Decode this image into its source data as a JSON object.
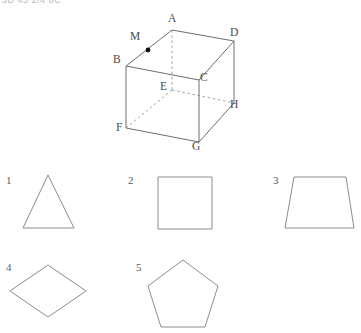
{
  "header": {
    "clipped_text": "3D 45 2/4 6C"
  },
  "cube": {
    "vertices": [
      {
        "id": "A",
        "label": "A",
        "label_x": 168,
        "label_y": 22,
        "x": 72,
        "y": 22
      },
      {
        "id": "D",
        "label": "D",
        "label_x": 230,
        "label_y": 36,
        "x": 134,
        "y": 33
      },
      {
        "id": "M",
        "label": "M",
        "label_x": 130,
        "label_y": 40,
        "x": 48,
        "y": 42
      },
      {
        "id": "B",
        "label": "B",
        "label_x": 113,
        "label_y": 63,
        "x": 26,
        "y": 58
      },
      {
        "id": "C",
        "label": "C",
        "label_x": 200,
        "label_y": 81,
        "x": 99,
        "y": 72
      },
      {
        "id": "E",
        "label": "E",
        "label_x": 160,
        "label_y": 90,
        "x": 72,
        "y": 82
      },
      {
        "id": "H",
        "label": "H",
        "label_x": 230,
        "label_y": 108,
        "x": 134,
        "y": 95
      },
      {
        "id": "F",
        "label": "F",
        "label_x": 116,
        "label_y": 131,
        "x": 26,
        "y": 120
      },
      {
        "id": "G",
        "label": "G",
        "label_x": 192,
        "label_y": 150,
        "x": 99,
        "y": 134
      }
    ],
    "marked_point": {
      "id": "M",
      "on_edge": "BA",
      "filled": true
    },
    "solid_edges": [
      "B-A",
      "A-D",
      "B-C",
      "C-D",
      "D-H",
      "B-F",
      "C-G",
      "F-G",
      "G-H"
    ],
    "hidden_edges": [
      "A-E",
      "E-F",
      "E-H"
    ]
  },
  "shapes": [
    {
      "number": "1",
      "name": "triangle",
      "num_x": 6,
      "num_y": 184,
      "points": "48,175 23,228 74,228"
    },
    {
      "number": "2",
      "name": "square",
      "num_x": 128,
      "num_y": 184,
      "points": "158,177 158,229 212,229 212,177"
    },
    {
      "number": "3",
      "name": "trapezoid",
      "num_x": 273,
      "num_y": 184,
      "points": "294,177 346,177 354,228 285,228"
    },
    {
      "number": "4",
      "name": "rhombus",
      "num_x": 6,
      "num_y": 271,
      "points": "48,265 86,291 48,317 10,291"
    },
    {
      "number": "5",
      "name": "pentagon",
      "num_x": 136,
      "num_y": 271,
      "points": "183,260 218,286 205,327 161,327 148,286"
    }
  ],
  "colors": {
    "stroke": "#8d8d8d",
    "edge": "#6e6e6e",
    "hidden_edge": "#9a9a9a",
    "label": "#4a4a4a",
    "point": "#111111",
    "background": "#ffffff"
  }
}
